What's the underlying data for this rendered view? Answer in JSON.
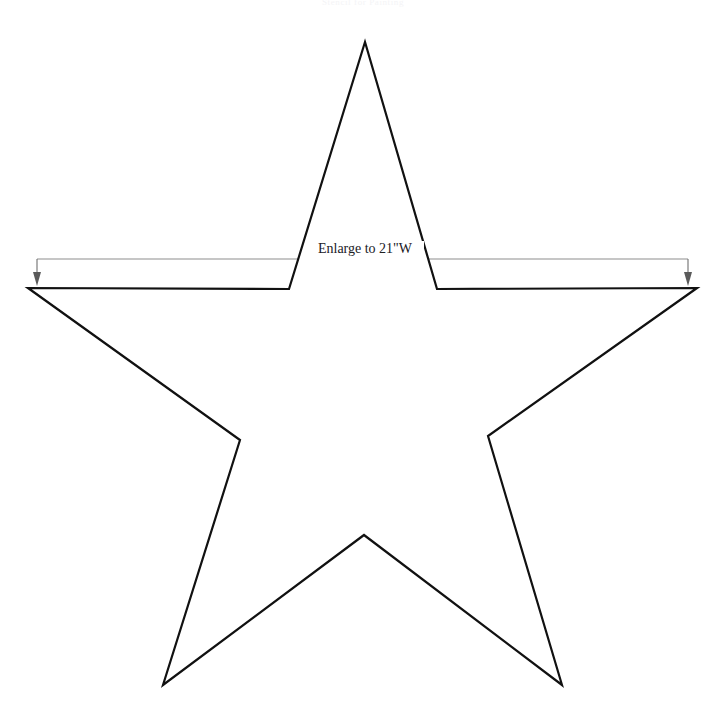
{
  "page": {
    "background_color": "#ffffff",
    "width": 726,
    "height": 723
  },
  "header": {
    "caption": "Stencil for Painting",
    "color": "#f4f4f6"
  },
  "dimension": {
    "label": "Enlarge to 21\"W",
    "text_color": "#20201f",
    "line_color": "#8d8d8d",
    "arrow_color": "#5a5a5a",
    "left_arrow_x": 37,
    "right_arrow_x": 688,
    "line_y": 259,
    "arrow_tip_y": 285
  },
  "shape": {
    "name": "five-pointed-star",
    "stroke_color": "#111111",
    "fill_color": "#ffffff",
    "stroke_width": 2.2,
    "points": [
      [
        365,
        42
      ],
      [
        437,
        289
      ],
      [
        697,
        288
      ],
      [
        488,
        436
      ],
      [
        562,
        685
      ],
      [
        364,
        535
      ],
      [
        163,
        685
      ],
      [
        240,
        440
      ],
      [
        28,
        288
      ],
      [
        289,
        289
      ]
    ],
    "path": "M 365 42 L 437 289 L 697 288 L 488 436 L 562 685 L 364 535 L 163 685 L 240 440 L 28 288 L 289 289 Z"
  }
}
